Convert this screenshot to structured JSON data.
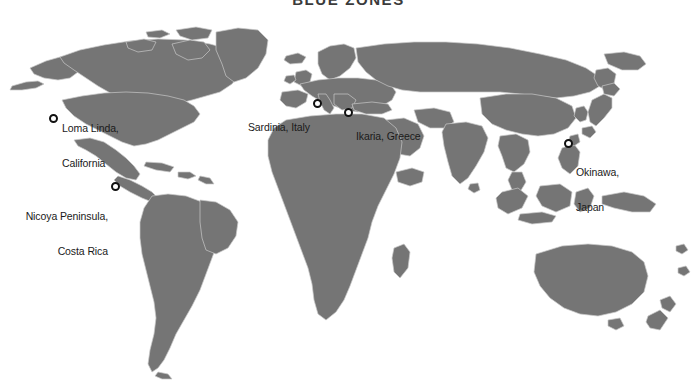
{
  "figure": {
    "title": "BLUE ZONES",
    "colors": {
      "land": "#757575",
      "border": "#c9c9c9",
      "ocean": "#ffffff",
      "marker_ring": "#111111",
      "marker_fill": "#ffffff",
      "label_text": "#1a1a1a"
    }
  },
  "map": {
    "type": "world-map",
    "projection": "equirectangular-like",
    "markers": [
      {
        "id": "loma-linda",
        "label_line1": "Loma Linda,",
        "label_line2": "California",
        "marker_x": 53,
        "marker_y": 118,
        "label_x": 62,
        "label_y": 100,
        "align": "left"
      },
      {
        "id": "nicoya-peninsula",
        "label_line1": "Nicoya Peninsula,",
        "label_line2": "Costa Rica",
        "marker_x": 115,
        "marker_y": 186,
        "label_x": 16,
        "label_y": 188,
        "align": "right"
      },
      {
        "id": "sardinia",
        "label_line1": "Sardinia, Italy",
        "label_line2": "",
        "marker_x": 317,
        "marker_y": 103,
        "label_x": 245,
        "label_y": 99,
        "align": "right"
      },
      {
        "id": "ikaria",
        "label_line1": "Ikaria, Greece",
        "label_line2": "",
        "marker_x": 348,
        "marker_y": 112,
        "label_x": 359,
        "label_y": 107,
        "align": "left"
      },
      {
        "id": "okinawa",
        "label_line1": "Okinawa,",
        "label_line2": "Japan",
        "marker_x": 568,
        "marker_y": 143,
        "label_x": 577,
        "label_y": 144,
        "align": "left"
      }
    ]
  }
}
